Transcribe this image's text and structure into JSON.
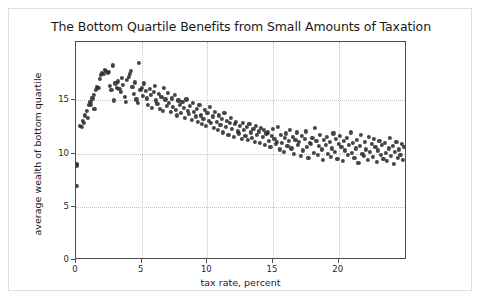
{
  "chart_data": {
    "type": "scatter",
    "title": "The Bottom Quartile Benefits from Small Amounts of Taxation",
    "xlabel": "tax rate, percent",
    "ylabel": "average wealth of bottom quartile",
    "xlim": [
      0,
      25.2
    ],
    "ylim": [
      0,
      20.5
    ],
    "xticks": [
      0,
      5,
      10,
      15,
      20
    ],
    "xticklabels": [
      "0",
      "5",
      "10",
      "15",
      "20"
    ],
    "yticks": [
      0,
      5,
      10,
      15
    ],
    "yticklabels": [
      "0",
      "5",
      "10",
      "15"
    ],
    "grid": true,
    "grid_style": "dotted",
    "grid_color": "#c4c4c4",
    "legend": null,
    "marker_color": "#2b2b2b",
    "marker_size": 4,
    "marker_shape": "circle",
    "points": [
      [
        0.05,
        9.0
      ],
      [
        0.08,
        8.9
      ],
      [
        0.1,
        7.0
      ],
      [
        0.3,
        12.6
      ],
      [
        0.45,
        12.5
      ],
      [
        0.5,
        13.1
      ],
      [
        0.6,
        12.9
      ],
      [
        0.7,
        13.6
      ],
      [
        0.8,
        14.0
      ],
      [
        0.9,
        13.4
      ],
      [
        1.0,
        14.6
      ],
      [
        1.1,
        14.9
      ],
      [
        1.15,
        14.6
      ],
      [
        1.25,
        15.2
      ],
      [
        1.35,
        15.5
      ],
      [
        1.4,
        14.2
      ],
      [
        1.5,
        16.0
      ],
      [
        1.6,
        16.3
      ],
      [
        1.7,
        16.2
      ],
      [
        1.8,
        17.0
      ],
      [
        1.9,
        17.4
      ],
      [
        2.0,
        17.6
      ],
      [
        2.1,
        17.5
      ],
      [
        2.2,
        17.9
      ],
      [
        2.3,
        17.8
      ],
      [
        2.4,
        17.6
      ],
      [
        2.5,
        17.7
      ],
      [
        2.6,
        16.4
      ],
      [
        2.7,
        16.0
      ],
      [
        2.8,
        18.3
      ],
      [
        2.9,
        15.0
      ],
      [
        3.0,
        16.6
      ],
      [
        3.1,
        16.2
      ],
      [
        3.2,
        16.8
      ],
      [
        3.3,
        16.1
      ],
      [
        3.4,
        15.8
      ],
      [
        3.5,
        17.1
      ],
      [
        3.6,
        16.5
      ],
      [
        3.7,
        15.3
      ],
      [
        3.8,
        14.9
      ],
      [
        3.9,
        16.9
      ],
      [
        4.0,
        17.2
      ],
      [
        4.1,
        17.5
      ],
      [
        4.2,
        17.8
      ],
      [
        4.3,
        16.3
      ],
      [
        4.4,
        15.6
      ],
      [
        4.5,
        16.7
      ],
      [
        4.6,
        15.1
      ],
      [
        4.7,
        14.8
      ],
      [
        4.8,
        18.5
      ],
      [
        4.9,
        16.0
      ],
      [
        5.0,
        16.2
      ],
      [
        5.1,
        15.4
      ],
      [
        5.2,
        16.6
      ],
      [
        5.3,
        15.9
      ],
      [
        5.4,
        15.2
      ],
      [
        5.5,
        14.6
      ],
      [
        5.6,
        16.1
      ],
      [
        5.7,
        15.5
      ],
      [
        5.8,
        14.3
      ],
      [
        5.9,
        15.8
      ],
      [
        6.0,
        16.4
      ],
      [
        6.1,
        15.0
      ],
      [
        6.2,
        14.7
      ],
      [
        6.3,
        15.6
      ],
      [
        6.4,
        14.2
      ],
      [
        6.5,
        15.3
      ],
      [
        6.6,
        14.0
      ],
      [
        6.7,
        16.2
      ],
      [
        6.8,
        15.1
      ],
      [
        6.9,
        14.5
      ],
      [
        7.0,
        15.7
      ],
      [
        7.1,
        14.8
      ],
      [
        7.2,
        13.9
      ],
      [
        7.3,
        15.2
      ],
      [
        7.4,
        14.4
      ],
      [
        7.5,
        15.5
      ],
      [
        7.6,
        14.1
      ],
      [
        7.7,
        13.6
      ],
      [
        7.8,
        15.0
      ],
      [
        7.9,
        14.6
      ],
      [
        8.0,
        13.8
      ],
      [
        8.1,
        14.9
      ],
      [
        8.2,
        14.3
      ],
      [
        8.3,
        13.4
      ],
      [
        8.4,
        15.1
      ],
      [
        8.5,
        14.0
      ],
      [
        8.6,
        13.7
      ],
      [
        8.7,
        14.5
      ],
      [
        8.8,
        13.2
      ],
      [
        8.9,
        14.8
      ],
      [
        9.0,
        13.9
      ],
      [
        9.1,
        13.5
      ],
      [
        9.2,
        14.2
      ],
      [
        9.3,
        13.0
      ],
      [
        9.4,
        14.6
      ],
      [
        9.5,
        13.6
      ],
      [
        9.6,
        12.8
      ],
      [
        9.7,
        13.3
      ],
      [
        9.8,
        14.1
      ],
      [
        9.9,
        12.6
      ],
      [
        10.0,
        13.8
      ],
      [
        10.1,
        13.1
      ],
      [
        10.2,
        14.4
      ],
      [
        10.3,
        12.9
      ],
      [
        10.4,
        13.5
      ],
      [
        10.5,
        12.4
      ],
      [
        10.6,
        13.9
      ],
      [
        10.7,
        13.0
      ],
      [
        10.8,
        12.2
      ],
      [
        10.9,
        13.6
      ],
      [
        11.0,
        12.7
      ],
      [
        11.1,
        13.3
      ],
      [
        11.2,
        12.0
      ],
      [
        11.3,
        13.8
      ],
      [
        11.4,
        12.5
      ],
      [
        11.5,
        13.1
      ],
      [
        11.6,
        11.8
      ],
      [
        11.7,
        12.9
      ],
      [
        11.8,
        13.4
      ],
      [
        11.9,
        12.3
      ],
      [
        12.0,
        11.6
      ],
      [
        12.1,
        12.8
      ],
      [
        12.2,
        13.0
      ],
      [
        12.3,
        12.1
      ],
      [
        12.4,
        11.9
      ],
      [
        12.5,
        12.6
      ],
      [
        12.6,
        11.4
      ],
      [
        12.7,
        12.9
      ],
      [
        12.8,
        12.2
      ],
      [
        12.9,
        11.7
      ],
      [
        13.0,
        12.5
      ],
      [
        13.1,
        11.3
      ],
      [
        13.2,
        12.8
      ],
      [
        13.3,
        12.0
      ],
      [
        13.4,
        11.5
      ],
      [
        13.5,
        12.3
      ],
      [
        13.6,
        11.1
      ],
      [
        13.7,
        12.6
      ],
      [
        13.8,
        11.8
      ],
      [
        13.9,
        12.1
      ],
      [
        14.0,
        11.0
      ],
      [
        14.1,
        12.4
      ],
      [
        14.2,
        11.6
      ],
      [
        14.3,
        12.2
      ],
      [
        14.4,
        10.8
      ],
      [
        14.5,
        11.9
      ],
      [
        14.6,
        12.0
      ],
      [
        14.7,
        11.2
      ],
      [
        14.8,
        10.6
      ],
      [
        14.9,
        11.7
      ],
      [
        15.0,
        12.3
      ],
      [
        15.1,
        11.4
      ],
      [
        15.2,
        10.9
      ],
      [
        15.3,
        11.1
      ],
      [
        15.4,
        12.5
      ],
      [
        15.5,
        10.4
      ],
      [
        15.6,
        11.8
      ],
      [
        15.7,
        11.0
      ],
      [
        15.8,
        10.2
      ],
      [
        15.9,
        11.5
      ],
      [
        16.0,
        11.9
      ],
      [
        16.1,
        10.7
      ],
      [
        16.2,
        11.2
      ],
      [
        16.3,
        12.2
      ],
      [
        16.4,
        10.5
      ],
      [
        16.5,
        11.6
      ],
      [
        16.6,
        10.0
      ],
      [
        16.7,
        11.3
      ],
      [
        16.8,
        12.0
      ],
      [
        16.9,
        10.8
      ],
      [
        17.0,
        11.1
      ],
      [
        17.1,
        9.8
      ],
      [
        17.2,
        11.7
      ],
      [
        17.3,
        10.3
      ],
      [
        17.4,
        11.4
      ],
      [
        17.5,
        12.1
      ],
      [
        17.6,
        10.6
      ],
      [
        17.7,
        9.6
      ],
      [
        17.8,
        11.0
      ],
      [
        17.9,
        10.9
      ],
      [
        18.0,
        11.5
      ],
      [
        18.1,
        10.1
      ],
      [
        18.2,
        12.4
      ],
      [
        18.3,
        11.2
      ],
      [
        18.4,
        9.9
      ],
      [
        18.5,
        10.7
      ],
      [
        18.6,
        11.8
      ],
      [
        18.7,
        10.4
      ],
      [
        18.8,
        9.4
      ],
      [
        18.9,
        11.3
      ],
      [
        19.0,
        10.8
      ],
      [
        19.1,
        11.6
      ],
      [
        19.2,
        10.0
      ],
      [
        19.3,
        11.1
      ],
      [
        19.4,
        9.7
      ],
      [
        19.5,
        10.5
      ],
      [
        19.6,
        11.9
      ],
      [
        19.7,
        10.2
      ],
      [
        19.8,
        11.4
      ],
      [
        19.9,
        9.5
      ],
      [
        20.0,
        10.9
      ],
      [
        20.1,
        11.7
      ],
      [
        20.2,
        10.6
      ],
      [
        20.3,
        9.3
      ],
      [
        20.4,
        11.2
      ],
      [
        20.5,
        10.3
      ],
      [
        20.6,
        11.5
      ],
      [
        20.7,
        9.9
      ],
      [
        20.8,
        10.8
      ],
      [
        20.9,
        12.0
      ],
      [
        21.0,
        10.1
      ],
      [
        21.1,
        11.0
      ],
      [
        21.2,
        9.6
      ],
      [
        21.3,
        10.5
      ],
      [
        21.4,
        11.3
      ],
      [
        21.5,
        9.1
      ],
      [
        21.6,
        10.7
      ],
      [
        21.7,
        11.8
      ],
      [
        21.8,
        10.0
      ],
      [
        21.9,
        9.8
      ],
      [
        22.0,
        11.1
      ],
      [
        22.1,
        10.4
      ],
      [
        22.2,
        9.4
      ],
      [
        22.3,
        11.6
      ],
      [
        22.4,
        10.2
      ],
      [
        22.5,
        10.9
      ],
      [
        22.6,
        9.7
      ],
      [
        22.7,
        11.4
      ],
      [
        22.8,
        10.6
      ],
      [
        22.9,
        9.2
      ],
      [
        23.0,
        10.3
      ],
      [
        23.1,
        11.2
      ],
      [
        23.2,
        9.9
      ],
      [
        23.3,
        10.8
      ],
      [
        23.4,
        9.5
      ],
      [
        23.5,
        11.0
      ],
      [
        23.6,
        10.1
      ],
      [
        23.7,
        9.3
      ],
      [
        23.8,
        10.5
      ],
      [
        23.9,
        11.5
      ],
      [
        24.0,
        9.8
      ],
      [
        24.1,
        10.7
      ],
      [
        24.2,
        9.0
      ],
      [
        24.3,
        10.2
      ],
      [
        24.4,
        11.1
      ],
      [
        24.5,
        9.6
      ],
      [
        24.6,
        10.4
      ],
      [
        24.7,
        9.9
      ],
      [
        24.8,
        10.9
      ],
      [
        24.9,
        9.4
      ],
      [
        25.0,
        10.6
      ]
    ]
  }
}
